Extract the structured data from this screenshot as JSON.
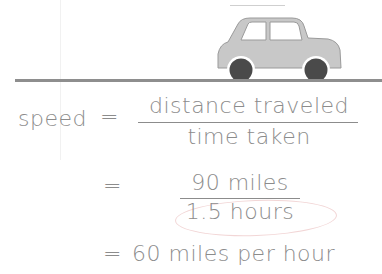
{
  "illustration": {
    "car": {
      "body_color": "#c8c8c8",
      "wheel_color": "#4a4a4a",
      "outline_color": "#9a9a9a"
    },
    "road_color": "#8e8e8e"
  },
  "equation": {
    "lhs": "speed",
    "eq1": "=",
    "numerator_1": "distance traveled",
    "denominator_1": "time taken",
    "eq2": "=",
    "numerator_2": "90 miles",
    "denominator_2": "1.5 hours",
    "eq3": "=",
    "result": "60 miles per hour"
  },
  "annotation": {
    "oval_color": "#f2d6d6",
    "circled_text": "1.5 hours"
  }
}
